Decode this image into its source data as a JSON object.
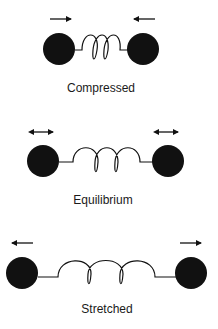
{
  "colors": {
    "ink": "#111111",
    "background": "#ffffff"
  },
  "states": [
    {
      "label": "Compressed",
      "left_arrow": "arrow-right-icon",
      "right_arrow": "arrow-left-icon"
    },
    {
      "label": "Equilibrium",
      "left_arrow": "arrow-double-icon",
      "right_arrow": "arrow-double-icon"
    },
    {
      "label": "Stretched",
      "left_arrow": "arrow-left-icon",
      "right_arrow": "arrow-right-icon"
    }
  ]
}
